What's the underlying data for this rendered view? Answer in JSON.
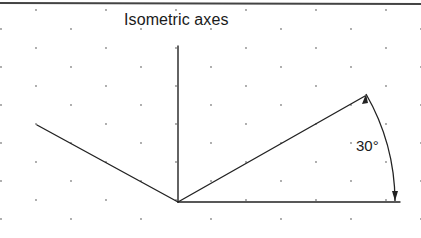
{
  "diagram": {
    "title": "Isometric axes",
    "angle_label": "30°",
    "colors": {
      "line": "#222222",
      "grid_dot": "#8a8a8a",
      "top_rule": "#444444",
      "background": "#ffffff"
    },
    "elements": {
      "origin": [
        178,
        202
      ],
      "vertical_axis": {
        "from": [
          178,
          202
        ],
        "to": [
          178,
          46
        ]
      },
      "left_axis": {
        "from": [
          178,
          202
        ],
        "to": [
          37,
          125
        ]
      },
      "right_axis": {
        "from": [
          178,
          202
        ],
        "to": [
          365,
          96
        ]
      },
      "baseline": {
        "from": [
          178,
          202
        ],
        "to": [
          400,
          202
        ]
      },
      "angle_arc": {
        "center": [
          178,
          202
        ],
        "radius": 217,
        "start_deg": 0,
        "end_deg": 30
      }
    },
    "grid": {
      "type": "isometric-dot-grid",
      "dx": 70,
      "dy": 19
    }
  }
}
